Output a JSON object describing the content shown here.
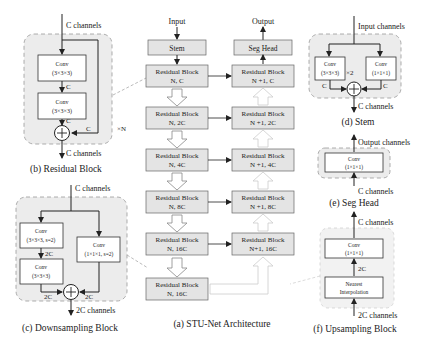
{
  "residual_block": {
    "caption": "(b) Residual Block",
    "input": "C channels",
    "output": "C channels",
    "conv1": {
      "title": "Conv",
      "kernel": "(3×3×3)"
    },
    "conv2": {
      "title": "Conv",
      "kernel": "(3×3×3)"
    },
    "edge_c1": "C",
    "edge_c2": "C",
    "skip_c": "C",
    "repeat": "×N"
  },
  "downsampling_block": {
    "caption": "(c) Downsampling Block",
    "input": "C channels",
    "output": "2C channels",
    "conv_a": {
      "title": "Conv",
      "kernel": "(3×3×3, s=2)"
    },
    "conv_b": {
      "title": "Conv",
      "kernel": "(3×3×3)"
    },
    "conv_skip": {
      "title": "Conv",
      "kernel": "(1×1×1, s=2)"
    },
    "edge_mid": "2C",
    "edge_left": "2C",
    "edge_right": "2C"
  },
  "architecture": {
    "caption": "(a) STU-Net Architecture",
    "input_label": "Input",
    "output_label": "Output",
    "stem": "Stem",
    "seg_head": "Seg Head",
    "encoder": [
      {
        "title": "Residual Block",
        "sub": "N, C"
      },
      {
        "title": "Residual Block",
        "sub": "N, 2C"
      },
      {
        "title": "Residual Block",
        "sub": "N, 4C"
      },
      {
        "title": "Residual Block",
        "sub": "N, 8C"
      },
      {
        "title": "Residual Block",
        "sub": "N, 16C"
      },
      {
        "title": "Residual Block",
        "sub": "N, 16C"
      }
    ],
    "decoder": [
      {
        "title": "Residual Block",
        "sub": "N +1, C"
      },
      {
        "title": "Residual Block",
        "sub": "N +1, 2C"
      },
      {
        "title": "Residual Block",
        "sub": "N +1, 4C"
      },
      {
        "title": "Residual Block",
        "sub": "N +1, 8C"
      },
      {
        "title": "Residual Block",
        "sub": "N+1, 16C"
      }
    ]
  },
  "stem_block": {
    "caption": "(d) Stem",
    "input": "Input channels",
    "output": "C channels",
    "conv_a": {
      "title": "Conv",
      "kernel": "(3×3×3)"
    },
    "conv_b": {
      "title": "Conv",
      "kernel": "(1×1×1)"
    },
    "repeat": "×2",
    "edge_left": "C",
    "edge_right": "C"
  },
  "seg_head_block": {
    "caption": "(e) Seg Head",
    "input": "C channels",
    "output": "Output channels",
    "conv": {
      "title": "Conv",
      "kernel": "(1×1×1)"
    }
  },
  "upsampling_block": {
    "caption": "(f) Upsampling Block",
    "input": "2C channels",
    "output": "C channels",
    "conv": {
      "title": "Conv",
      "kernel": "(1×1×1)"
    },
    "interp": {
      "line1": "Nearest",
      "line2": "Interpolation"
    },
    "edge_mid": "2C"
  }
}
